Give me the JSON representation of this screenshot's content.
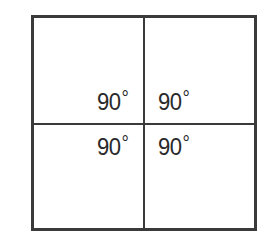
{
  "diagram": {
    "angles": [
      {
        "position": "top-left",
        "value": "90",
        "unit": "°"
      },
      {
        "position": "top-right",
        "value": "90",
        "unit": "°"
      },
      {
        "position": "bottom-left",
        "value": "90",
        "unit": "°"
      },
      {
        "position": "bottom-right",
        "value": "90",
        "unit": "°"
      }
    ],
    "colors": {
      "line": "#3a3a3a",
      "text": "#2a2a2a",
      "background": "#ffffff"
    }
  }
}
